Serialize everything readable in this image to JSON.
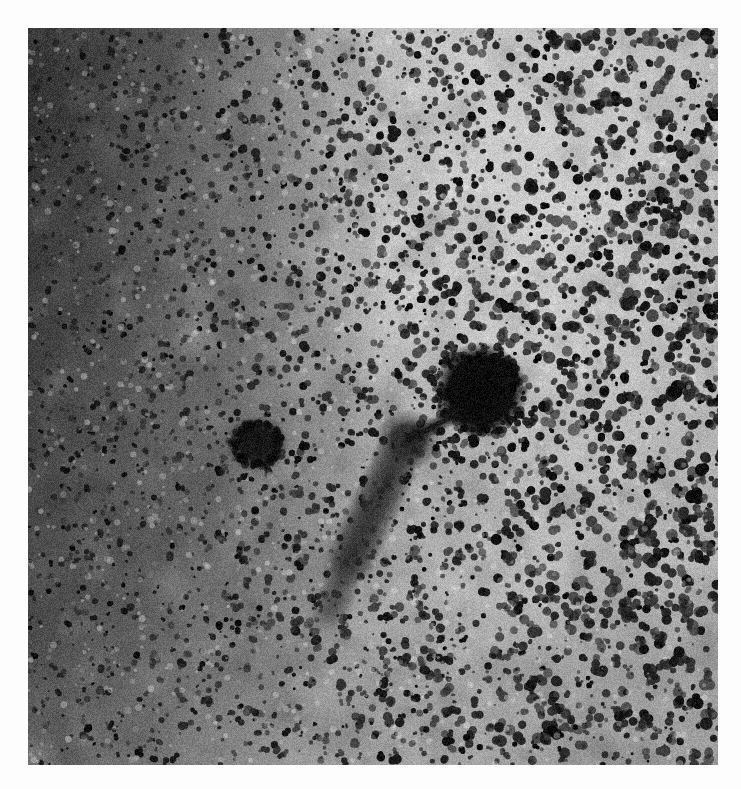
{
  "page": {
    "background_color": "#fdfdfd",
    "width": 741,
    "height": 789,
    "caption": ""
  },
  "micrograph": {
    "name": "transmission-electron-micrograph",
    "description": "Negative-stain transmission electron micrograph showing a tailed bacteriophage-like particle against a coarse grainy stained background",
    "plate": {
      "left": 28,
      "top": 28,
      "width": 690,
      "height": 737,
      "border_color": "#fdfdfd"
    },
    "palette": {
      "outer_background": "#fdfdfd",
      "plate_light_background": "#b9b9b9",
      "plate_dark_background": "#3b3b3b",
      "grain_dark": "#141414",
      "grain_mid": "#6a6a6a",
      "grain_light": "#d8d8d8",
      "particle_core": "#0a0a0a"
    },
    "background_gradient": {
      "type": "horizontal-dark-to-light",
      "stops": [
        {
          "position": 0.0,
          "color": "#3b3b3b"
        },
        {
          "position": 0.11,
          "color": "#5d5d5d"
        },
        {
          "position": 0.26,
          "color": "#8d8d8d"
        },
        {
          "position": 0.42,
          "color": "#ababab"
        },
        {
          "position": 0.62,
          "color": "#b9b9b9"
        },
        {
          "position": 0.82,
          "color": "#b4b4b4"
        },
        {
          "position": 1.0,
          "color": "#a8a8a8"
        }
      ],
      "bright_zone": {
        "cx_frac": 0.78,
        "cy_frac": 0.28,
        "rx_frac": 0.55,
        "ry_frac": 0.6
      }
    },
    "grain": {
      "description": "dense randomly-scattered dark stain grains over the whole plate",
      "count": 5200,
      "min_radius_px": 1.1,
      "max_radius_px": 5.2,
      "darkness_min": 0.35,
      "darkness_max": 1.0,
      "seed": 20240517
    },
    "features": [
      {
        "id": "phage-head",
        "label": "large dark icosahedral head",
        "shape": "ellipse",
        "cx": 453,
        "cy": 362,
        "rx": 36,
        "ry": 37,
        "softness_px": 10,
        "opacity": 1.0,
        "color": "#080808"
      },
      {
        "id": "phage-collar",
        "label": "dense collar / baseplate region",
        "shape": "ellipse",
        "cx": 380,
        "cy": 412,
        "rx": 20,
        "ry": 18,
        "softness_px": 14,
        "opacity": 0.82,
        "color": "#151515"
      },
      {
        "id": "phage-tail",
        "label": "tail connecting head to baseplate",
        "shape": "line",
        "x1": 430,
        "y1": 385,
        "x2": 384,
        "y2": 410,
        "thickness_px": 9,
        "softness_px": 5,
        "opacity": 0.85,
        "color": "#1a1a1a"
      },
      {
        "id": "small-particle",
        "label": "smaller dark particle to the left",
        "shape": "ellipse",
        "cx": 229,
        "cy": 416,
        "rx": 21,
        "ry": 19,
        "softness_px": 11,
        "opacity": 0.95,
        "color": "#101010"
      },
      {
        "id": "fiber-streak-main",
        "label": "diffuse fibrous streak descending left from baseplate",
        "shape": "line",
        "x1": 372,
        "y1": 425,
        "x2": 318,
        "y2": 540,
        "thickness_px": 22,
        "softness_px": 16,
        "opacity": 0.42,
        "color": "#2a2a2a"
      },
      {
        "id": "fiber-streak-lower",
        "label": "faint lower fiber tail",
        "shape": "line",
        "x1": 322,
        "y1": 530,
        "x2": 300,
        "y2": 590,
        "thickness_px": 14,
        "softness_px": 14,
        "opacity": 0.3,
        "color": "#303030"
      },
      {
        "id": "halo-diffuse",
        "label": "broad diffuse stain halo around the particle complex",
        "shape": "ellipse",
        "cx": 355,
        "cy": 440,
        "rx": 118,
        "ry": 108,
        "softness_px": 60,
        "opacity": 0.2,
        "color": "#4a4a4a"
      },
      {
        "id": "dark-patch-upper-left",
        "label": "dark stain accumulation along the left margin",
        "shape": "ellipse",
        "cx": 40,
        "cy": 230,
        "rx": 120,
        "ry": 230,
        "softness_px": 90,
        "opacity": 0.45,
        "color": "#1e1e1e"
      },
      {
        "id": "dark-patch-lower-left",
        "label": "mottled darker region lower left",
        "shape": "ellipse",
        "cx": 120,
        "cy": 600,
        "rx": 180,
        "ry": 190,
        "softness_px": 110,
        "opacity": 0.26,
        "color": "#2c2c2c"
      },
      {
        "id": "dark-patch-bottom",
        "label": "slightly darker bottom band",
        "shape": "ellipse",
        "cx": 400,
        "cy": 720,
        "rx": 330,
        "ry": 120,
        "softness_px": 110,
        "opacity": 0.14,
        "color": "#3a3a3a"
      }
    ]
  }
}
